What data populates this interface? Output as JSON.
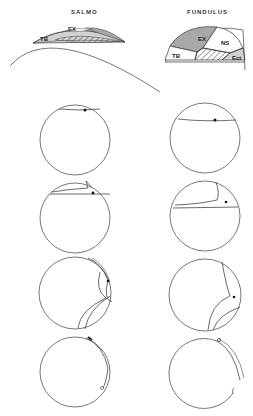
{
  "columns": [
    {
      "title": "SALMO"
    },
    {
      "title": "FUNDULUS"
    }
  ],
  "regions": {
    "salmo": [
      "TB",
      "EX",
      "NS"
    ],
    "fundulus": [
      "EX",
      "NS",
      "TB",
      "Ect"
    ]
  },
  "labels": {
    "ex": "EX",
    "ns": "NS",
    "tb": "TB",
    "ect": "Ect"
  },
  "colors": {
    "line": "#555555",
    "stipple": "#9a9a9a",
    "background": "#ffffff"
  }
}
